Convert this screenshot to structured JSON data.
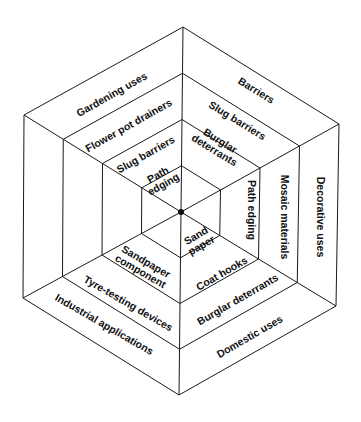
{
  "diagram": {
    "center": [
      181,
      212
    ],
    "outer_vertices": [
      [
        183,
        27
      ],
      [
        339,
        124
      ],
      [
        336,
        306
      ],
      [
        179,
        395
      ],
      [
        23,
        298
      ],
      [
        24,
        115
      ]
    ],
    "ring_scales": [
      1,
      0.75,
      0.5,
      0.25
    ],
    "colors": {
      "line": "#1a1a1a",
      "text": "#111111",
      "background": "#ffffff"
    },
    "sectors": {
      "gardening": {
        "bands": [
          "Gardening uses",
          "Flower pot drainers",
          "Slug barriers",
          "Path edging"
        ]
      },
      "barriers": {
        "bands": [
          "Barriers",
          "Slug barriers",
          "Burglar deterrants"
        ]
      },
      "decorative": {
        "bands": [
          "Decorative uses",
          "Mosaic materials",
          "Path edging"
        ]
      },
      "domestic": {
        "bands": [
          "Domestic uses",
          "Burglar deterrants",
          "Coat hooks",
          "Sand paper"
        ]
      },
      "industrial": {
        "bands": [
          "Industrial applications",
          "Tyre-testing devices",
          "Sandpaper component"
        ]
      }
    },
    "labels": [
      {
        "id": "gardening-uses",
        "lines": [
          "Gardening uses"
        ],
        "x": 112,
        "y": 95,
        "rot": -29.5
      },
      {
        "id": "flower-pot-drainers",
        "lines": [
          "Flower pot drainers"
        ],
        "x": 129,
        "y": 126,
        "rot": -29.5
      },
      {
        "id": "slug-barriers-left",
        "lines": [
          "Slug barriers"
        ],
        "x": 146,
        "y": 155,
        "rot": -29.5
      },
      {
        "id": "path-edging-inner",
        "lines": [
          "Path",
          "edging"
        ],
        "x": 161,
        "y": 180,
        "rot": -29.5
      },
      {
        "id": "barriers",
        "lines": [
          "Barriers"
        ],
        "x": 256,
        "y": 91,
        "rot": 31.5
      },
      {
        "id": "slug-barriers-right",
        "lines": [
          "Slug barriers"
        ],
        "x": 237,
        "y": 121,
        "rot": 31.5
      },
      {
        "id": "burglar-deterrants-top",
        "lines": [
          "Burglar",
          "deterrants"
        ],
        "x": 217,
        "y": 146,
        "rot": 31.5
      },
      {
        "id": "path-edging-right",
        "lines": [
          "Path edging"
        ],
        "x": 251,
        "y": 210,
        "rot": 90
      },
      {
        "id": "mosaic-materials",
        "lines": [
          "Mosaic materials"
        ],
        "x": 284,
        "y": 217,
        "rot": 90
      },
      {
        "id": "decorative-uses",
        "lines": [
          "Decorative uses"
        ],
        "x": 320,
        "y": 217,
        "rot": 90
      },
      {
        "id": "sand-paper",
        "lines": [
          "Sand",
          "paper"
        ],
        "x": 199,
        "y": 241,
        "rot": -30
      },
      {
        "id": "coat-hooks",
        "lines": [
          "Coat hooks"
        ],
        "x": 222,
        "y": 274,
        "rot": -30
      },
      {
        "id": "burglar-deterrants-bottom",
        "lines": [
          "Burglar deterrants"
        ],
        "x": 238,
        "y": 300,
        "rot": -30
      },
      {
        "id": "domestic-uses",
        "lines": [
          "Domestic uses"
        ],
        "x": 250,
        "y": 337,
        "rot": -30
      },
      {
        "id": "sandpaper-component",
        "lines": [
          "Sandpaper",
          "component"
        ],
        "x": 143,
        "y": 267,
        "rot": 30
      },
      {
        "id": "tyre-testing-devices",
        "lines": [
          "Tyre-testing devices"
        ],
        "x": 128,
        "y": 304,
        "rot": 30
      },
      {
        "id": "industrial-applications",
        "lines": [
          "Industrial applications"
        ],
        "x": 104,
        "y": 325,
        "rot": 30
      }
    ]
  }
}
